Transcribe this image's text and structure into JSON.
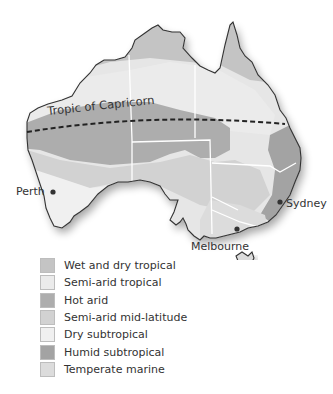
{
  "map": {
    "title": "Climate zones of Australia",
    "tropic_label": "Tropic of Capricorn",
    "cities": [
      {
        "name": "Perth"
      },
      {
        "name": "Sydney"
      },
      {
        "name": "Melbourne"
      }
    ]
  },
  "legend": {
    "items": [
      {
        "label": "Wet and dry tropical",
        "color": "#c4c4c4"
      },
      {
        "label": "Semi-arid tropical",
        "color": "#ebebeb"
      },
      {
        "label": "Hot arid",
        "color": "#adadad"
      },
      {
        "label": "Semi-arid mid-latitude",
        "color": "#d2d2d2"
      },
      {
        "label": "Dry subtropical",
        "color": "#f0f0f0"
      },
      {
        "label": "Humid subtropical",
        "color": "#a3a3a3"
      },
      {
        "label": "Temperate marine",
        "color": "#dcdcdc"
      }
    ]
  }
}
